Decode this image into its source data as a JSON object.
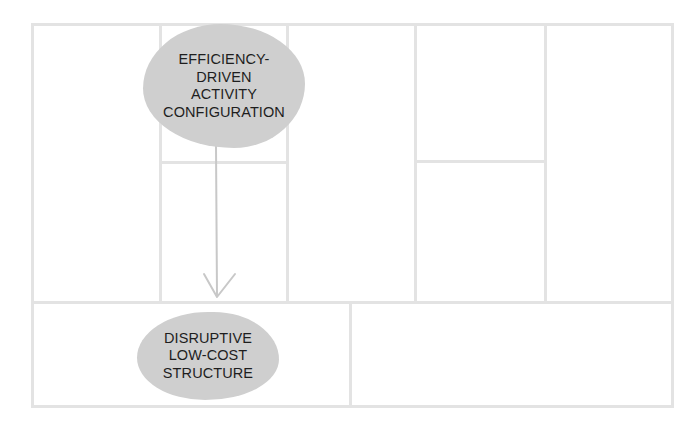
{
  "diagram": {
    "type": "business-model-canvas",
    "grid": {
      "outer_box": {
        "x": 32,
        "y": 24,
        "width": 641,
        "height": 383
      },
      "top_section_columns": 5,
      "bottom_section_columns": 2,
      "line_color": "#e3e3e3"
    },
    "nodes": [
      {
        "id": "efficiency",
        "label": "EFFICIENCY-\nDRIVEN\nACTIVITY\nCONFIGURATION",
        "fill": "#cfcfcf"
      },
      {
        "id": "lowcost",
        "label": "DISRUPTIVE\nLOW-COST\nSTRUCTURE",
        "fill": "#cfcfcf"
      }
    ],
    "edges": [
      {
        "from": "efficiency",
        "to": "lowcost",
        "style": "arrow",
        "color": "#c8c8c8"
      }
    ]
  }
}
